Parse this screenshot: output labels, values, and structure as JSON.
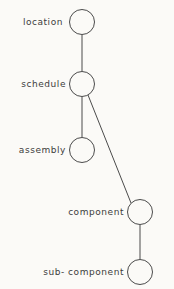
{
  "diagram": {
    "type": "tree",
    "title": "",
    "background_color": "#fbfaf7",
    "stroke_color": "#4b4b4b",
    "text_color": "#3c3c3c",
    "node_radius": 12.5,
    "nodes": [
      {
        "id": "location",
        "label": "location",
        "cx": 82,
        "cy": 22,
        "label_right_edge": 63,
        "label_baseline_y": 17
      },
      {
        "id": "schedule",
        "label": "schedule",
        "cx": 82,
        "cy": 84,
        "label_right_edge": 66,
        "label_baseline_y": 79
      },
      {
        "id": "assembly",
        "label": "assembly",
        "cx": 82,
        "cy": 150,
        "label_right_edge": 66,
        "label_baseline_y": 145
      },
      {
        "id": "component",
        "label": "component",
        "cx": 140,
        "cy": 212,
        "label_right_edge": 124,
        "label_baseline_y": 207
      },
      {
        "id": "sub-component",
        "label": "sub- component",
        "cx": 140,
        "cy": 272,
        "label_right_edge": 124,
        "label_baseline_y": 267
      }
    ],
    "edges": [
      {
        "id": "location-schedule",
        "from": "location",
        "to": "schedule",
        "x1": 82,
        "y1": 35,
        "x2": 82,
        "y2": 71
      },
      {
        "id": "schedule-assembly",
        "from": "schedule",
        "to": "assembly",
        "x1": 82,
        "y1": 97,
        "x2": 82,
        "y2": 137
      },
      {
        "id": "schedule-component",
        "from": "schedule",
        "to": "component",
        "x1": 88,
        "y1": 95,
        "x2": 131,
        "y2": 203
      },
      {
        "id": "component-subcomponent",
        "from": "component",
        "to": "sub-component",
        "x1": 140,
        "y1": 225,
        "x2": 140,
        "y2": 259
      }
    ]
  }
}
